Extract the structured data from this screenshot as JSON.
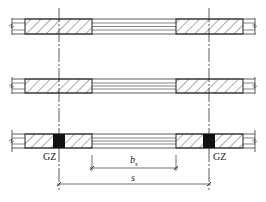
{
  "diagram": {
    "type": "wall-opening-plan",
    "rows": [
      {
        "name": "wall-row-1",
        "has_columns": false
      },
      {
        "name": "wall-row-2",
        "has_columns": false
      },
      {
        "name": "wall-row-3",
        "has_columns": true
      }
    ],
    "labels": {
      "left_column": "GZ",
      "right_column": "GZ",
      "opening_width": "b",
      "opening_width_sub": "s",
      "wall_spacing": "s"
    },
    "colors": {
      "line": "#222222",
      "column_fill": "#111111",
      "background": "#ffffff"
    }
  }
}
